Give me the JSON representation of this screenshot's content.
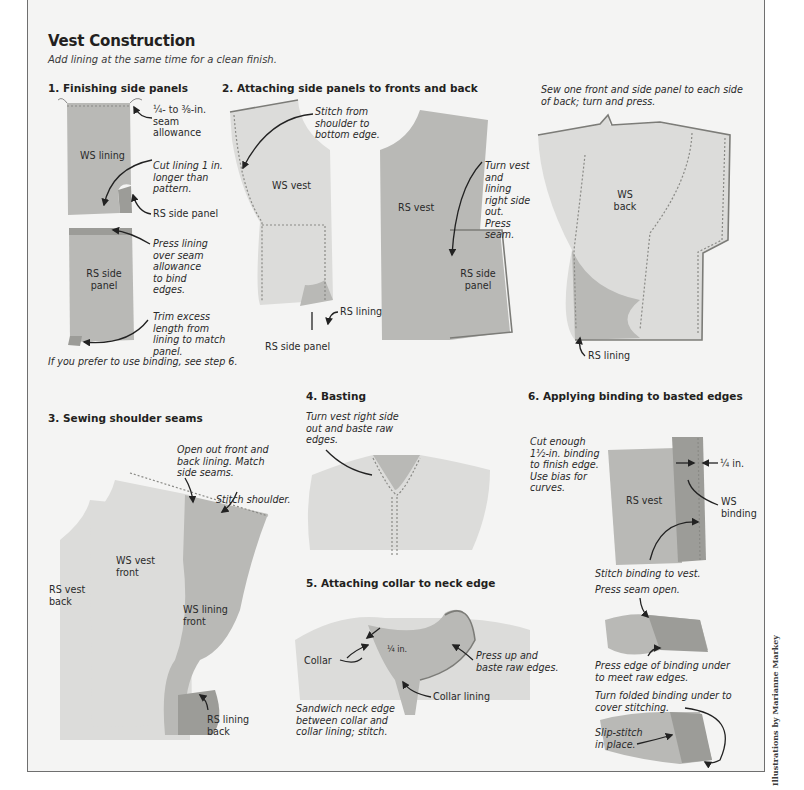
{
  "page": {
    "title": "Vest Construction",
    "subtitle": "Add lining at the same time for a clean finish.",
    "credit": "Illustrations by Marianne Markey"
  },
  "steps": [
    {
      "heading": "1. Finishing side panels",
      "notes": {
        "seam_allowance": "¼- to ⅜-in. seam allowance",
        "cut_lining": "Cut lining 1 in. longer than pattern.",
        "press_lining": "Press lining over seam allowance to bind edges.",
        "trim": "Trim excess length from lining to match panel.",
        "footer": "If you prefer to use binding, see step 6."
      },
      "labels": {
        "ws_lining": "WS lining",
        "rs_side_panel": "RS side panel",
        "rs_side_panel_2": "RS side panel"
      }
    },
    {
      "heading": "2. Attaching side panels to fronts and back",
      "notes": {
        "stitch_from": "Stitch from shoulder to bottom edge.",
        "turn_vest": "Turn vest and lining right side out. Press seam.",
        "sew_one": "Sew one front and side panel to each side of back; turn and press."
      },
      "labels": {
        "ws_vest": "WS vest",
        "rs_lining": "RS lining",
        "rs_side_panel": "RS side panel",
        "rs_vest": "RS vest",
        "rs_side_panel_2": "RS side panel",
        "ws_back": "WS back",
        "rs_lining_2": "RS lining"
      }
    },
    {
      "heading": "3. Sewing shoulder seams",
      "notes": {
        "open_out": "Open out front and back lining. Match side seams.",
        "stitch_shoulder": "Stitch shoulder."
      },
      "labels": {
        "rs_vest_back": "RS vest back",
        "ws_vest_front": "WS vest front",
        "ws_lining_front": "WS lining front",
        "rs_lining_back": "RS lining back"
      }
    },
    {
      "heading": "4. Basting",
      "notes": {
        "turn_vest": "Turn vest right side out and baste raw edges."
      }
    },
    {
      "heading": "5. Attaching collar to neck edge",
      "notes": {
        "press_up": "Press up and baste raw edges.",
        "sandwich": "Sandwich neck edge between collar and collar lining; stitch."
      },
      "labels": {
        "collar": "Collar",
        "quarter_in": "¼ in.",
        "collar_lining": "Collar lining"
      }
    },
    {
      "heading": "6. Applying binding to basted edges",
      "notes": {
        "cut_enough": "Cut enough 1½-in. binding to finish edge. Use bias for curves.",
        "stitch_binding": "Stitch binding to vest.",
        "press_seam": "Press seam open.",
        "press_edge": "Press edge of binding under to meet raw edges.",
        "turn_folded": "Turn folded binding under to cover stitching.",
        "slip_stitch": "Slip-stitch in place."
      },
      "labels": {
        "rs_vest": "RS vest",
        "quarter_in": "¼ in.",
        "ws_binding": "WS binding"
      }
    }
  ],
  "icons": [
    "arrow-icon"
  ]
}
